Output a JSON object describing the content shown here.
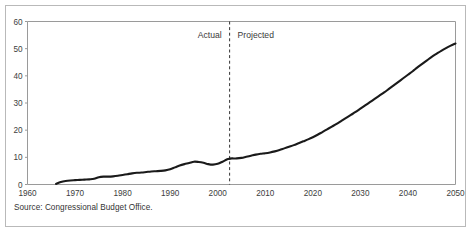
{
  "figure": {
    "source_note": "Source: Congressional Budget Office.",
    "frame_color": "#b9b9b9",
    "line_color": "#1a1a1a",
    "axis_color": "#9a9a9a",
    "background": "#ffffff"
  },
  "annotations": {
    "actual_label": "Actual",
    "projected_label": "Projected",
    "divider_year": 2002.5
  },
  "chart_data": {
    "type": "line",
    "title": "",
    "subtitle": "",
    "xlabel": "",
    "ylabel": "",
    "xlim": [
      1960,
      2050
    ],
    "ylim": [
      0,
      60
    ],
    "grid": false,
    "legend": null,
    "xticks": [
      1960,
      1970,
      1980,
      1990,
      2000,
      2010,
      2020,
      2030,
      2040,
      2050
    ],
    "yticks": [
      0,
      10,
      20,
      30,
      40,
      50,
      60
    ],
    "xtick_labels": [
      "1960",
      "1970",
      "1980",
      "1990",
      "2000",
      "2010",
      "2020",
      "2030",
      "2040",
      "2050"
    ],
    "ytick_labels": [
      "0",
      "10",
      "20",
      "30",
      "40",
      "50",
      "60"
    ],
    "annotations": [
      {
        "text": "Actual",
        "x": 1995,
        "y": 55
      },
      {
        "text": "Projected",
        "x": 2012,
        "y": 55
      }
    ],
    "series": [
      {
        "name": "Spending",
        "segment_actual": {
          "x": [
            1966,
            1967,
            1968,
            1969,
            1970,
            1971,
            1972,
            1973,
            1974,
            1975,
            1976,
            1977,
            1978,
            1979,
            1980,
            1981,
            1982,
            1983,
            1984,
            1985,
            1986,
            1987,
            1988,
            1989,
            1990,
            1991,
            1992,
            1993,
            1994,
            1995,
            1996,
            1997,
            1998,
            1999,
            2000,
            2001,
            2002,
            2002.5
          ],
          "y": [
            0.2,
            0.9,
            1.3,
            1.5,
            1.6,
            1.7,
            1.8,
            1.9,
            2.1,
            2.7,
            2.9,
            2.9,
            3.0,
            3.2,
            3.5,
            3.8,
            4.1,
            4.3,
            4.4,
            4.6,
            4.8,
            4.9,
            5.0,
            5.2,
            5.6,
            6.3,
            7.0,
            7.5,
            7.9,
            8.4,
            8.3,
            8.0,
            7.5,
            7.3,
            7.6,
            8.4,
            9.3,
            9.5
          ]
        },
        "segment_projected": {
          "x": [
            2002.5,
            2003,
            2004,
            2005,
            2006,
            2007,
            2008,
            2009,
            2010,
            2011,
            2012,
            2013,
            2014,
            2015,
            2016,
            2017,
            2018,
            2019,
            2020,
            2021,
            2022,
            2023,
            2024,
            2025,
            2026,
            2027,
            2028,
            2029,
            2030,
            2031,
            2032,
            2033,
            2034,
            2035,
            2036,
            2037,
            2038,
            2039,
            2040,
            2041,
            2042,
            2043,
            2044,
            2045,
            2046,
            2047,
            2048,
            2049,
            2050
          ],
          "y": [
            9.5,
            9.6,
            9.6,
            9.8,
            10.2,
            10.6,
            11.0,
            11.3,
            11.5,
            11.8,
            12.2,
            12.7,
            13.3,
            13.9,
            14.5,
            15.2,
            15.9,
            16.6,
            17.4,
            18.3,
            19.3,
            20.3,
            21.3,
            22.3,
            23.4,
            24.5,
            25.6,
            26.7,
            27.9,
            29.1,
            30.3,
            31.5,
            32.7,
            33.9,
            35.2,
            36.5,
            37.8,
            39.1,
            40.4,
            41.7,
            43.1,
            44.4,
            45.7,
            47.0,
            48.1,
            49.2,
            50.2,
            51.1,
            51.9
          ]
        }
      }
    ]
  }
}
